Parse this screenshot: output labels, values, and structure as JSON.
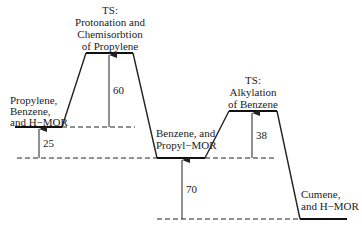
{
  "diagram": {
    "type": "energy-profile",
    "states": [
      {
        "id": "reactants",
        "lines": [
          "Propylene,",
          "Benzene,",
          "and H−MOR"
        ]
      },
      {
        "id": "ts1",
        "lines": [
          "TS:",
          "Protonation and",
          "Chemisorbtion",
          "of Propylene"
        ]
      },
      {
        "id": "intermediate",
        "lines": [
          "Benzene, and",
          "Propyl−MOR"
        ]
      },
      {
        "id": "ts2",
        "lines": [
          "TS:",
          "Alkylation",
          "of Benzene"
        ]
      },
      {
        "id": "products",
        "lines": [
          "Cumene,",
          "and H−MOR"
        ]
      }
    ],
    "energy_gaps": [
      {
        "from": "reactants",
        "to": "ts1",
        "value": "60"
      },
      {
        "from": "intermediate",
        "to": "reactants",
        "value": "25"
      },
      {
        "from": "intermediate",
        "to": "ts2",
        "value": "38"
      },
      {
        "from": "products",
        "to": "intermediate",
        "value": "70"
      }
    ]
  }
}
